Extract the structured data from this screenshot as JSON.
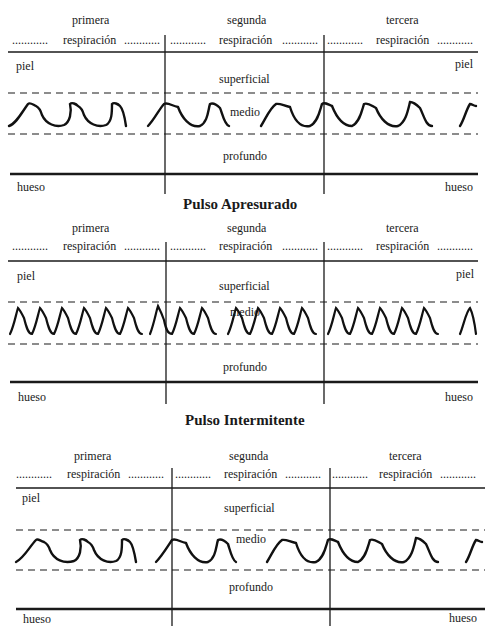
{
  "panels": [
    {
      "title": "",
      "columns": [
        {
          "ordinal": "primera",
          "label": "respiración"
        },
        {
          "ordinal": "segunda",
          "label": "respiración"
        },
        {
          "ordinal": "tercera",
          "label": "respiración"
        }
      ],
      "layers": {
        "top": "piel",
        "superficial": "superficial",
        "middle": "medio",
        "deep": "profundo",
        "bottom": "hueso",
        "top_right": "piel",
        "bottom_right": "hueso"
      }
    },
    {
      "title": "Pulso Apresurado",
      "columns": [
        {
          "ordinal": "primera",
          "label": "respiración"
        },
        {
          "ordinal": "segunda",
          "label": "respiración"
        },
        {
          "ordinal": "tercera",
          "label": "respiración"
        }
      ],
      "layers": {
        "top": "piel",
        "superficial": "superficial",
        "middle": "medio",
        "deep": "profundo",
        "bottom": "hueso",
        "top_right": "piel",
        "bottom_right": "hueso"
      }
    },
    {
      "title": "Pulso Intermitente",
      "columns": [
        {
          "ordinal": "primera",
          "label": "respiración"
        },
        {
          "ordinal": "segunda",
          "label": "respiración"
        },
        {
          "ordinal": "tercera",
          "label": "respiración"
        }
      ],
      "layers": {
        "top": "piel",
        "superficial": "superficial",
        "middle": "medio",
        "deep": "profundo",
        "bottom": "hueso",
        "top_right": "piel",
        "bottom_right": "hueso"
      }
    }
  ],
  "dots": "............"
}
